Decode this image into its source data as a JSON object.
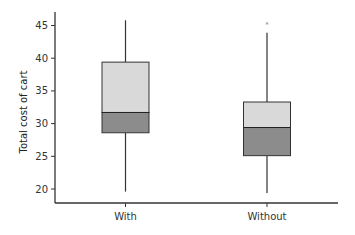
{
  "chart_data": {
    "type": "box",
    "title": "",
    "xlabel": "",
    "ylabel": "Total cost of cart",
    "ylim": [
      17.5,
      47
    ],
    "yticks": [
      20,
      25,
      30,
      35,
      40,
      45
    ],
    "categories": [
      "With",
      "Without"
    ],
    "grid": false,
    "boxes": [
      {
        "name": "With",
        "whisker_low": 19.6,
        "q1": 28.6,
        "median": 31.7,
        "q3": 39.4,
        "whisker_high": 45.8,
        "outliers": []
      },
      {
        "name": "Without",
        "whisker_low": 19.4,
        "q1": 25.1,
        "median": 29.4,
        "q3": 33.3,
        "whisker_high": 43.9,
        "outliers": [
          45.2
        ]
      }
    ],
    "colors": {
      "upper_box": "#d9d9d9",
      "lower_box": "#8c8c8c",
      "outline": "#333333",
      "outlier": "#888888"
    }
  }
}
